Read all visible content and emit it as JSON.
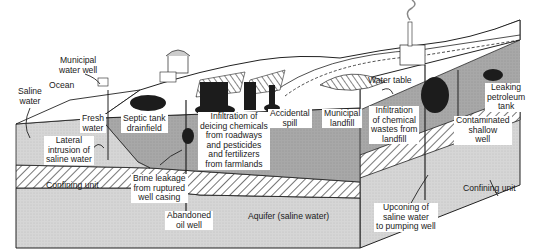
{
  "diagram": {
    "type": "cross-section",
    "colors": {
      "background": "#ffffff",
      "aquifer_fresh": "#a9a9a9",
      "aquifer_saline": "#d4d4d4",
      "confining_hatch": "#3a3a3a",
      "contaminant_plume": "#1c1c1c",
      "land_surface": "#ffffff",
      "outline": "#222222"
    },
    "labels": {
      "municipal_water_well": "Municipal\nwater well",
      "ocean": "Ocean",
      "saline_water": "Saline\nwater",
      "fresh_water": "Fresh\nwater",
      "septic_tank_drainfield": "Septic tank\ndrainfield",
      "lateral_intrusion": "Lateral\nintrusion of\nsaline water",
      "confining_unit_left": "Confining unit",
      "brine_leakage": "Brine leakage\nfrom ruptured\nwell casing",
      "abandoned_oil_well": "Abandoned\noil well",
      "deicing_infiltration": "Infiltration of\ndeicing chemicals\nfrom roadways\nand pesticides\nand fertilizers\nfrom farmlands",
      "accidental_spill": "Accidental\nspill",
      "municipal_landfill": "Municipal\nlandfill",
      "water_table": "Water table",
      "aquifer_saline": "Aquifer (saline water)",
      "chemical_wastes": "Infiltration\nof chemical\nwastes from\nlandfill",
      "leaking_petroleum_tank": "Leaking\npetroleum\ntank",
      "contaminated_shallow_well": "Contaminated\nshallow\nwell",
      "confining_unit_right": "Confining unit",
      "upconing": "Upconing of\nsaline water\nto pumping well"
    }
  }
}
